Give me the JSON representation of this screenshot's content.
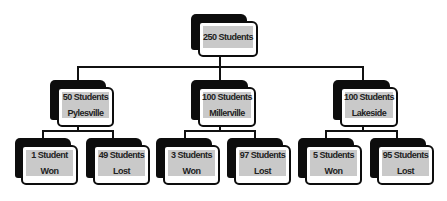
{
  "diagram": {
    "type": "tree",
    "root": {
      "line1": "250 Students"
    },
    "schools": [
      {
        "line1": "50 Students",
        "line2": "Pylesville",
        "children": [
          {
            "line1": "1 Student",
            "line2": "Won"
          },
          {
            "line1": "49 Students",
            "line2": "Lost"
          }
        ]
      },
      {
        "line1": "100 Students",
        "line2": "Millerville",
        "children": [
          {
            "line1": "3 Students",
            "line2": "Won"
          },
          {
            "line1": "97 Students",
            "line2": "Lost"
          }
        ]
      },
      {
        "line1": "100 Students",
        "line2": "Lakeside",
        "children": [
          {
            "line1": "5 Students",
            "line2": "Won"
          },
          {
            "line1": "95 Students",
            "line2": "Lost"
          }
        ]
      }
    ]
  },
  "colors": {
    "box_fill": "#c9c9c9",
    "shadow": "#0d0d0d",
    "line": "#111111",
    "text": "#222222"
  }
}
